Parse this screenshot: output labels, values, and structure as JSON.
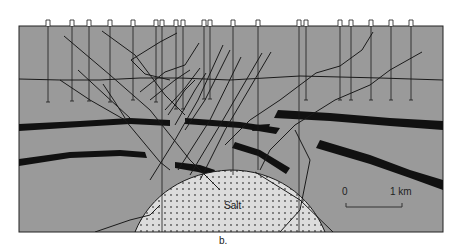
{
  "figure": {
    "caption": "b.",
    "salt_label": "Salt",
    "scale_bar": {
      "start_label": "0",
      "end_label": "1 km"
    },
    "colors": {
      "background_strata": "#9a9a9a",
      "marker_beds": "#111111",
      "salt_fill": "#dcdcdc",
      "salt_dots": "#555555",
      "lines": "#1a1a1a"
    },
    "wells": [
      48,
      72,
      89,
      110,
      133,
      156,
      162,
      176,
      183,
      204,
      210,
      233,
      258,
      299,
      306,
      340,
      351,
      371,
      391,
      411
    ]
  }
}
